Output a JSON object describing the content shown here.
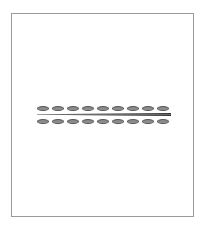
{
  "diagram": {
    "type": "gel-bands",
    "colors": {
      "band_fill": "#8c8c8c",
      "band_outline": "#555555",
      "frame": "#9a9a9a",
      "line": "#333333"
    },
    "top_row": {
      "y": 106,
      "band_count": 9,
      "x_positions": [
        37,
        52,
        67,
        82,
        97,
        112,
        127,
        142,
        157
      ]
    },
    "bottom_row": {
      "y": 119,
      "band_count": 9,
      "x_positions": [
        37,
        52,
        67,
        82,
        97,
        112,
        127,
        142,
        157
      ]
    },
    "divider": {
      "description": "tapered line between rows, thicker at right end"
    }
  }
}
